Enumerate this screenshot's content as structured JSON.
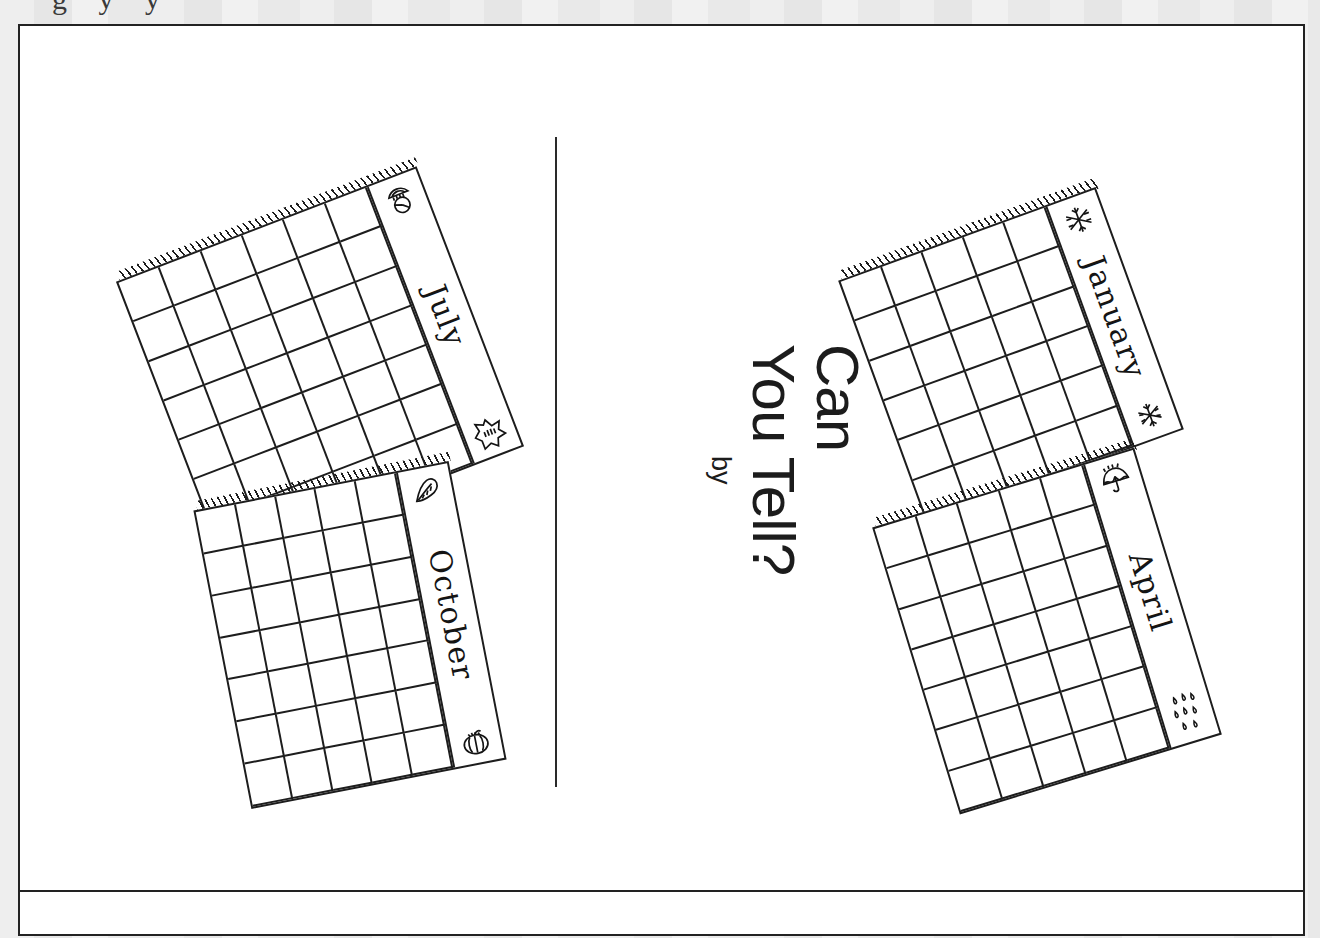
{
  "document": {
    "kind": "worksheet-cover-page",
    "top_cropped_text": "g y y",
    "background_color": "#e9e9e9",
    "page_color": "#ffffff",
    "ink_color": "#1d1d1d"
  },
  "cover": {
    "title_line_1": "Can",
    "title_line_2": "You Tell?",
    "byline_label": "by",
    "rotation_degrees": 90
  },
  "divider": {
    "name": "center-fold-line",
    "orientation": "vertical"
  },
  "calendars": [
    {
      "month": "July",
      "icon_top": "watermelon-slice-icon",
      "icon_bottom": "sun-icon",
      "columns": 6,
      "rows": 7,
      "rotation_degrees": -21,
      "side": "left"
    },
    {
      "month": "October",
      "icon_top": "oak-leaf-icon",
      "icon_bottom": "pumpkin-icon",
      "columns": 5,
      "rows": 7,
      "rotation_degrees": -11,
      "side": "left"
    },
    {
      "month": "January",
      "icon_top": "snowflake-icon",
      "icon_bottom": "snowflake-icon",
      "columns": 5,
      "rows": 6,
      "rotation_degrees": -20,
      "side": "right"
    },
    {
      "month": "April",
      "icon_top": "umbrella-icon",
      "icon_bottom": "raindrops-icon",
      "columns": 5,
      "rows": 7,
      "rotation_degrees": -17,
      "side": "right"
    }
  ]
}
